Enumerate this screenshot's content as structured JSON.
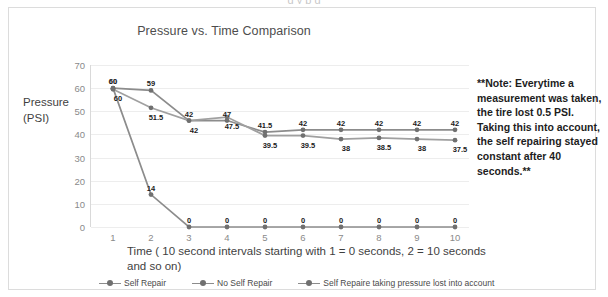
{
  "top_cut_text": "g                  y p           g",
  "chart_data": {
    "type": "line",
    "title": "Pressure vs. Time Comparison",
    "xlabel": "Time ( 10 second intervals starting with 1 = 0 seconds, 2 = 10 seconds and so on)",
    "ylabel": "Pressure (PSI)",
    "categories": [
      "1",
      "2",
      "3",
      "4",
      "5",
      "6",
      "7",
      "8",
      "9",
      "10"
    ],
    "ylim": [
      0,
      70
    ],
    "yticks": [
      0,
      10,
      20,
      30,
      40,
      50,
      60,
      70
    ],
    "grid": true,
    "legend_position": "bottom",
    "series": [
      {
        "name": "Self Repair",
        "color": "#8c8c8c",
        "values": [
          60,
          59,
          46,
          46,
          41,
          42,
          42,
          42,
          42,
          42
        ],
        "labels": [
          "60",
          "59",
          "42",
          "47",
          "41.5",
          "42",
          "42",
          "42",
          "42",
          "42"
        ]
      },
      {
        "name": "No Self Repair",
        "color": "#8c8c8c",
        "values": [
          60,
          14,
          0,
          0,
          0,
          0,
          0,
          0,
          0,
          0
        ],
        "labels": [
          "60",
          "14",
          "0",
          "0",
          "0",
          "0",
          "0",
          "0",
          "0",
          "0"
        ]
      },
      {
        "name": "Self Repaire taking pressure lost into account",
        "color": "#a0a0a0",
        "values": [
          59.5,
          51.5,
          46,
          47.5,
          39.5,
          39.5,
          38,
          38.5,
          38,
          37.5
        ],
        "labels": [
          "60",
          "51.5",
          "42",
          "47.5",
          "39.5",
          "39.5",
          "38",
          "38.5",
          "38",
          "37.5"
        ]
      }
    ],
    "annotation": "**Note: Everytime a measurement was taken, the tire lost 0.5 PSI. Taking this into account, the self repairing stayed constant after 40 seconds.**"
  },
  "axis_title_y_line1": "Pressure",
  "axis_title_y_line2": "(PSI)",
  "colors": {
    "line": "#8c8c8c",
    "marker": "#707070",
    "grid": "#ededed",
    "tick_text": "#8a8a8a",
    "frame": "#dcdcdc"
  }
}
